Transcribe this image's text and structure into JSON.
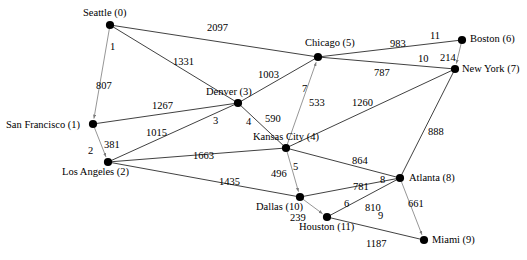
{
  "figure": {
    "kind": "weighted-graph-diagram",
    "background_color": "#ffffff",
    "edge_color": "#2b2b2b",
    "tree_edge_color": "#8a8a8a",
    "node_color": "#000000",
    "width": 527,
    "height": 260
  },
  "nodes": [
    {
      "id": 0,
      "name": "Seattle (0)",
      "city": "Seattle",
      "index": "0",
      "x": 110,
      "y": 25,
      "label_x": 83,
      "label_y": 8
    },
    {
      "id": 1,
      "name": "San Francisco (1)",
      "city": "San Francisco",
      "index": "1",
      "x": 93,
      "y": 124,
      "label_x": 6,
      "label_y": 120
    },
    {
      "id": 2,
      "name": "Los Angeles (2)",
      "city": "Los Angeles",
      "index": "2",
      "x": 108,
      "y": 162,
      "label_x": 62,
      "label_y": 167
    },
    {
      "id": 3,
      "name": "Denver (3)",
      "city": "Denver",
      "index": "3",
      "x": 238,
      "y": 103,
      "label_x": 206,
      "label_y": 87
    },
    {
      "id": 4,
      "name": "Kansas City (4)",
      "city": "Kansas City",
      "index": "4",
      "x": 286,
      "y": 148,
      "label_x": 253,
      "label_y": 132
    },
    {
      "id": 5,
      "name": "Chicago (5)",
      "city": "Chicago",
      "index": "5",
      "x": 318,
      "y": 57,
      "label_x": 305,
      "label_y": 38
    },
    {
      "id": 6,
      "name": "Boston (6)",
      "city": "Boston",
      "index": "6",
      "x": 462,
      "y": 40,
      "label_x": 470,
      "label_y": 34
    },
    {
      "id": 7,
      "name": "New York (7)",
      "city": "New York",
      "index": "7",
      "x": 455,
      "y": 69,
      "label_x": 462,
      "label_y": 64
    },
    {
      "id": 8,
      "name": "Atlanta (8)",
      "city": "Atlanta",
      "index": "8",
      "x": 400,
      "y": 178,
      "label_x": 409,
      "label_y": 173
    },
    {
      "id": 9,
      "name": "Miami (9)",
      "city": "Miami",
      "index": "9",
      "x": 424,
      "y": 240,
      "label_x": 432,
      "label_y": 235
    },
    {
      "id": 10,
      "name": "Dallas (10)",
      "city": "Dallas",
      "index": "10",
      "x": 300,
      "y": 197,
      "label_x": 256,
      "label_y": 202
    },
    {
      "id": 11,
      "name": "Houston (11)",
      "city": "Houston",
      "index": "11",
      "x": 327,
      "y": 217,
      "label_x": 299,
      "label_y": 222
    }
  ],
  "edges": [
    {
      "from": 0,
      "to": 5,
      "weight": "2097",
      "label_x": 207,
      "label_y": 23,
      "tree": false
    },
    {
      "from": 0,
      "to": 3,
      "weight": "1331",
      "label_x": 173,
      "label_y": 57,
      "tree": false
    },
    {
      "from": 0,
      "to": 1,
      "weight": "807",
      "label_x": 96,
      "label_y": 81,
      "tree": true
    },
    {
      "from": 1,
      "to": 3,
      "weight": "1267",
      "label_x": 152,
      "label_y": 101,
      "tree": false
    },
    {
      "from": 1,
      "to": 2,
      "weight": "381",
      "label_x": 104,
      "label_y": 140,
      "tree": true
    },
    {
      "from": 2,
      "to": 3,
      "weight": "1015",
      "label_x": 146,
      "label_y": 128,
      "tree": false
    },
    {
      "from": 2,
      "to": 4,
      "weight": "1663",
      "label_x": 193,
      "label_y": 151,
      "tree": false
    },
    {
      "from": 2,
      "to": 10,
      "weight": "1435",
      "label_x": 219,
      "label_y": 177,
      "tree": false
    },
    {
      "from": 3,
      "to": 5,
      "weight": "1003",
      "label_x": 258,
      "label_y": 70,
      "tree": false
    },
    {
      "from": 3,
      "to": 4,
      "weight": "590",
      "label_x": 265,
      "label_y": 114,
      "tree": false
    },
    {
      "from": 4,
      "to": 5,
      "weight": "533",
      "label_x": 309,
      "label_y": 98,
      "tree": true
    },
    {
      "from": 4,
      "to": 7,
      "weight": "1260",
      "label_x": 352,
      "label_y": 98,
      "tree": false
    },
    {
      "from": 4,
      "to": 8,
      "weight": "864",
      "label_x": 352,
      "label_y": 156,
      "tree": false
    },
    {
      "from": 4,
      "to": 10,
      "weight": "496",
      "label_x": 271,
      "label_y": 169,
      "tree": true
    },
    {
      "from": 5,
      "to": 6,
      "weight": "983",
      "label_x": 390,
      "label_y": 39,
      "tree": false
    },
    {
      "from": 5,
      "to": 7,
      "weight": "787",
      "label_x": 374,
      "label_y": 68,
      "tree": false
    },
    {
      "from": 6,
      "to": 7,
      "weight": "214",
      "label_x": 440,
      "label_y": 53,
      "tree": true
    },
    {
      "from": 7,
      "to": 8,
      "weight": "888",
      "label_x": 428,
      "label_y": 127,
      "tree": false
    },
    {
      "from": 8,
      "to": 10,
      "weight": "781",
      "label_x": 353,
      "label_y": 182,
      "tree": false
    },
    {
      "from": 8,
      "to": 11,
      "weight": "810",
      "label_x": 365,
      "label_y": 203,
      "tree": false
    },
    {
      "from": 8,
      "to": 9,
      "weight": "661",
      "label_x": 408,
      "label_y": 199,
      "tree": true
    },
    {
      "from": 10,
      "to": 11,
      "weight": "239",
      "label_x": 290,
      "label_y": 213,
      "tree": true
    },
    {
      "from": 11,
      "to": 9,
      "weight": "1187",
      "label_x": 366,
      "label_y": 239,
      "tree": false
    }
  ],
  "parent_labels": [
    {
      "text": "1",
      "x": 110,
      "y": 42,
      "for": "seattle-to-san-francisco"
    },
    {
      "text": "2",
      "x": 88,
      "y": 146,
      "for": "san-francisco-to-los-angeles"
    },
    {
      "text": "3",
      "x": 213,
      "y": 116,
      "for": "denver-tree-branch"
    },
    {
      "text": "4",
      "x": 246,
      "y": 117,
      "for": "denver-to-kansas-city"
    },
    {
      "text": "5",
      "x": 293,
      "y": 162,
      "for": "kansas-city-to-dallas"
    },
    {
      "text": "6",
      "x": 344,
      "y": 199,
      "for": "dallas-to-houston"
    },
    {
      "text": "7",
      "x": 302,
      "y": 84,
      "for": "chicago-to-kansas-city"
    },
    {
      "text": "8",
      "x": 380,
      "y": 175,
      "for": "atlanta-branch"
    },
    {
      "text": "9",
      "x": 378,
      "y": 211,
      "for": "atlanta-to-miami"
    },
    {
      "text": "10",
      "x": 418,
      "y": 54,
      "for": "new-york-branch"
    },
    {
      "text": "11",
      "x": 430,
      "y": 31,
      "for": "boston-branch"
    }
  ]
}
